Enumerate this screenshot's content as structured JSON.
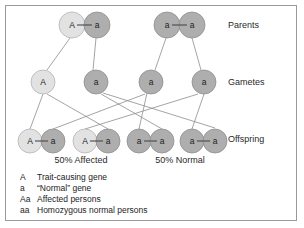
{
  "figure": {
    "colors": {
      "allele_dominant_fill": "#e2e2e2",
      "allele_recessive_fill": "#aeaeae",
      "link_line": "#8d8d8d",
      "frame": "#9a9a9a",
      "text": "#1d1d1d"
    }
  },
  "rows": [
    {
      "id": "parents",
      "label": "Parents",
      "label_x": 228,
      "label_y": 28
    },
    {
      "id": "gametes",
      "label": "Gametes",
      "label_x": 228,
      "label_y": 85
    },
    {
      "id": "offspring",
      "label": "Offspring",
      "label_x": 228,
      "label_y": 142
    }
  ],
  "parents": [
    {
      "id": "parent-1",
      "alleles": [
        {
          "text": "A",
          "type": "dominant",
          "cx": 72,
          "cy": 25,
          "r": 13
        },
        {
          "text": "a",
          "type": "recessive",
          "cx": 97,
          "cy": 25,
          "r": 13
        }
      ]
    },
    {
      "id": "parent-2",
      "alleles": [
        {
          "text": "a",
          "type": "recessive",
          "cx": 167,
          "cy": 25,
          "r": 13
        },
        {
          "text": "a",
          "type": "recessive",
          "cx": 192,
          "cy": 25,
          "r": 13
        }
      ]
    }
  ],
  "gametes": [
    {
      "id": "gamete-1",
      "text": "A",
      "type": "dominant",
      "cx": 43,
      "cy": 82,
      "r": 12
    },
    {
      "id": "gamete-2",
      "text": "a",
      "type": "recessive",
      "cx": 96,
      "cy": 82,
      "r": 12
    },
    {
      "id": "gamete-3",
      "text": "a",
      "type": "recessive",
      "cx": 151,
      "cy": 82,
      "r": 12
    },
    {
      "id": "gamete-4",
      "text": "a",
      "type": "recessive",
      "cx": 204,
      "cy": 82,
      "r": 12
    }
  ],
  "offspring": [
    {
      "id": "offspring-1",
      "genotype": "Aa",
      "alleles": [
        {
          "text": "A",
          "type": "dominant",
          "cx": 30,
          "cy": 141,
          "r": 12
        },
        {
          "text": "a",
          "type": "recessive",
          "cx": 53,
          "cy": 141,
          "r": 12
        }
      ]
    },
    {
      "id": "offspring-2",
      "genotype": "Aa",
      "alleles": [
        {
          "text": "A",
          "type": "dominant",
          "cx": 85,
          "cy": 141,
          "r": 12
        },
        {
          "text": "a",
          "type": "recessive",
          "cx": 108,
          "cy": 141,
          "r": 12
        }
      ]
    },
    {
      "id": "offspring-3",
      "genotype": "aa",
      "alleles": [
        {
          "text": "a",
          "type": "recessive",
          "cx": 139,
          "cy": 141,
          "r": 12
        },
        {
          "text": "a",
          "type": "recessive",
          "cx": 162,
          "cy": 141,
          "r": 12
        }
      ]
    },
    {
      "id": "offspring-4",
      "genotype": "aa",
      "alleles": [
        {
          "text": "a",
          "type": "recessive",
          "cx": 192,
          "cy": 141,
          "r": 12
        },
        {
          "text": "a",
          "type": "recessive",
          "cx": 215,
          "cy": 141,
          "r": 12
        }
      ]
    }
  ],
  "ratios": [
    {
      "id": "ratio-affected",
      "text": "50% Affected",
      "x": 81,
      "y": 163
    },
    {
      "id": "ratio-normal",
      "text": "50% Normal",
      "x": 180,
      "y": 163
    }
  ],
  "legend": {
    "items": [
      {
        "key": "A",
        "text": "Trait-causing gene",
        "y": 180
      },
      {
        "key": "a",
        "text": "“Normal” gene",
        "y": 191
      },
      {
        "key": "Aa",
        "text": "Affected persons",
        "y": 202
      },
      {
        "key": "aa",
        "text": "Homozygous normal persons",
        "y": 213
      }
    ],
    "key_x": 20,
    "text_x": 37
  },
  "links": {
    "parent_to_gamete": [
      {
        "id": "p1-g1",
        "x1": 70,
        "y1": 38,
        "x2": 47,
        "y2": 70
      },
      {
        "id": "p1-g2",
        "x1": 96,
        "y1": 38,
        "x2": 93,
        "y2": 70
      },
      {
        "id": "p2-g3",
        "x1": 166,
        "y1": 38,
        "x2": 155,
        "y2": 70
      },
      {
        "id": "p2-g4",
        "x1": 192,
        "y1": 38,
        "x2": 201,
        "y2": 70
      }
    ],
    "gamete_to_offspring": [
      {
        "id": "g1-o1",
        "x1": 43,
        "y1": 94,
        "x2": 30,
        "y2": 129
      },
      {
        "id": "g1-o2",
        "x1": 47,
        "y1": 94,
        "x2": 108,
        "y2": 129
      },
      {
        "id": "g2-o3",
        "x1": 101,
        "y1": 94,
        "x2": 162,
        "y2": 129
      },
      {
        "id": "g2-o4",
        "x1": 103,
        "y1": 93,
        "x2": 215,
        "y2": 128
      },
      {
        "id": "g3-o1",
        "x1": 145,
        "y1": 94,
        "x2": 53,
        "y2": 129
      },
      {
        "id": "g3-o2",
        "x1": 147,
        "y1": 93,
        "x2": 139,
        "y2": 129
      },
      {
        "id": "g4-o2",
        "x1": 198,
        "y1": 94,
        "x2": 85,
        "y2": 129
      },
      {
        "id": "g4-o4",
        "x1": 204,
        "y1": 94,
        "x2": 192,
        "y2": 129
      }
    ]
  }
}
